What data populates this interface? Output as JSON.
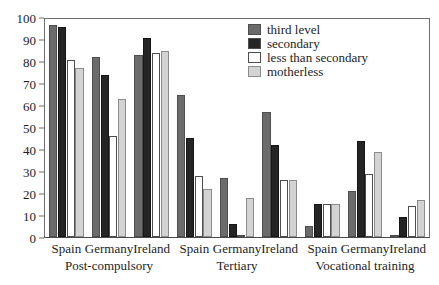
{
  "chart_data": {
    "type": "bar",
    "title": "",
    "subtitle": "",
    "xlabel": "",
    "ylabel": "",
    "ylim": [
      0,
      100
    ],
    "ytick_labels": [
      "100",
      "90",
      "80",
      "70",
      "60",
      "50",
      "40",
      "30",
      "20",
      "10",
      "0"
    ],
    "ytick_values": [
      100,
      90,
      80,
      70,
      60,
      50,
      40,
      30,
      20,
      10,
      0
    ],
    "grid": false,
    "legend_position": "top-right",
    "categories": [
      "Spain",
      "Germany",
      "Ireland",
      "Spain",
      "Germany",
      "Ireland",
      "Spain",
      "Germany",
      "Ireland"
    ],
    "groups": [
      {
        "label": "Post-compulsory",
        "countries": [
          "Spain",
          "Germany",
          "Ireland"
        ]
      },
      {
        "label": "Tertiary",
        "countries": [
          "Spain",
          "Germany",
          "Ireland"
        ]
      },
      {
        "label": "Vocational training",
        "countries": [
          "Spain",
          "Germany",
          "Ireland"
        ]
      }
    ],
    "series": [
      {
        "name": "third level",
        "color": "#6b6b6b",
        "values": [
          97,
          82,
          83,
          65,
          27,
          57,
          5,
          21,
          1
        ]
      },
      {
        "name": "secondary",
        "color": "#252525",
        "values": [
          96,
          74,
          91,
          45,
          6,
          42,
          15,
          44,
          9
        ]
      },
      {
        "name": "less than secondary",
        "color": "#ffffff",
        "values": [
          81,
          46,
          84,
          28,
          1,
          26,
          15,
          29,
          14
        ]
      },
      {
        "name": "motherless",
        "color": "#d3d3d3",
        "values": [
          77,
          63,
          85,
          22,
          18,
          26,
          15,
          39,
          17
        ]
      }
    ]
  },
  "legend": {
    "items": [
      {
        "label": "third level",
        "color": "#6b6b6b"
      },
      {
        "label": "secondary",
        "color": "#252525"
      },
      {
        "label": "less than secondary",
        "color": "#ffffff"
      },
      {
        "label": "motherless",
        "color": "#d3d3d3"
      }
    ]
  }
}
